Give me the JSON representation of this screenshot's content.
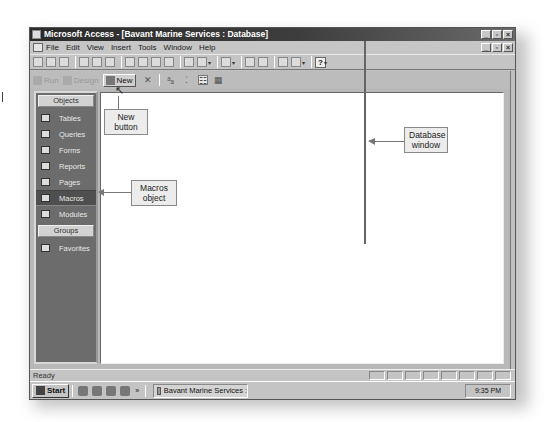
{
  "window": {
    "title": "Microsoft Access - [Bavant Marine Services : Database]",
    "controls": [
      "minimize",
      "restore",
      "close"
    ]
  },
  "menubar": {
    "items": [
      "File",
      "Edit",
      "View",
      "Insert",
      "Tools",
      "Window",
      "Help"
    ]
  },
  "toolbar": {
    "icons": [
      "new-icon",
      "open-icon",
      "save-icon",
      "print-icon",
      "print-preview-icon",
      "spelling-icon",
      "cut-icon",
      "copy-icon",
      "paste-icon",
      "format-painter-icon",
      "undo-icon",
      "office-links-icon",
      "analyze-icon",
      "properties-icon",
      "relationships-icon",
      "new-object-icon",
      "help-icon"
    ]
  },
  "db_toolbar": {
    "run": "Run",
    "design": "Design",
    "new": "New",
    "icons": [
      "delete-icon",
      "large-icons-icon",
      "small-icons-icon",
      "list-icon",
      "details-icon"
    ]
  },
  "objects_bar": {
    "objects_header": "Objects",
    "items": [
      {
        "label": "Tables",
        "icon": "table-icon",
        "selected": false
      },
      {
        "label": "Queries",
        "icon": "query-icon",
        "selected": false
      },
      {
        "label": "Forms",
        "icon": "form-icon",
        "selected": false
      },
      {
        "label": "Reports",
        "icon": "report-icon",
        "selected": false
      },
      {
        "label": "Pages",
        "icon": "page-icon",
        "selected": false
      },
      {
        "label": "Macros",
        "icon": "macro-icon",
        "selected": true
      },
      {
        "label": "Modules",
        "icon": "module-icon",
        "selected": false
      }
    ],
    "groups_header": "Groups",
    "groups": [
      {
        "label": "Favorites",
        "icon": "favorites-icon"
      }
    ]
  },
  "statusbar": {
    "text": "Ready"
  },
  "taskbar": {
    "start": "Start",
    "quick_chevron": "»",
    "task_button": "Bavant Marine Services :",
    "clock": "9:35 PM"
  },
  "callouts": {
    "new_button": "New button",
    "macros_object": "Macros object",
    "database_window": "Database window"
  }
}
